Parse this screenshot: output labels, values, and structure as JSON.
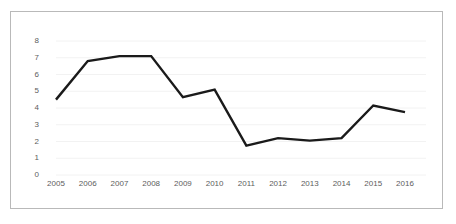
{
  "chart_data": {
    "type": "line",
    "title": "",
    "xlabel": "",
    "ylabel": "",
    "categories": [
      "2005",
      "2006",
      "2007",
      "2008",
      "2009",
      "2010",
      "2011",
      "2012",
      "2013",
      "2014",
      "2015",
      "2016"
    ],
    "values": [
      4.5,
      6.8,
      7.1,
      7.1,
      4.65,
      5.1,
      1.75,
      2.2,
      2.05,
      2.2,
      4.15,
      3.75
    ],
    "series": [
      {
        "name": "",
        "values": [
          4.5,
          6.8,
          7.1,
          7.1,
          4.65,
          5.1,
          1.75,
          2.2,
          2.05,
          2.2,
          4.15,
          3.75
        ],
        "color": "#1a1a1a"
      }
    ],
    "ylim": [
      0,
      8
    ],
    "y_ticks": [
      0,
      1,
      2,
      3,
      4,
      5,
      6,
      7,
      8
    ],
    "y_tick_labels": [
      "0",
      "1",
      "2",
      "3",
      "4",
      "5",
      "6",
      "7",
      "8"
    ],
    "x_tick_labels": [
      "2005",
      "2006",
      "2007",
      "2008",
      "2009",
      "2010",
      "2011",
      "2012",
      "2013",
      "2014",
      "2015",
      "2016"
    ],
    "grid": true,
    "grid_axis": "y",
    "grid_color": "#f2f2f2",
    "legend": false,
    "legend_position": "none",
    "border_color": "#b9b9b9",
    "background_color": "#ffffff",
    "line_color": "#1a1a1a",
    "line_width": 2.4,
    "markers": false,
    "tick_label_color": "#5d5d5d"
  }
}
